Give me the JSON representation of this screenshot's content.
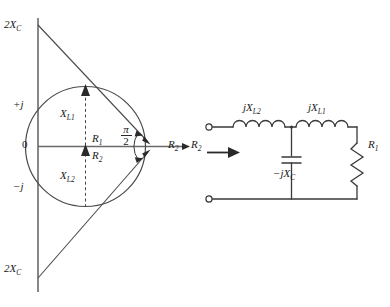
{
  "figure": {
    "type": "engineering-diagram"
  },
  "circle_diagram": {
    "axis_top_label": "2X",
    "axis_top_sub": "C",
    "axis_bottom_label": "2X",
    "axis_bottom_sub": "C",
    "axis_pos_imag": "+j",
    "axis_origin": "0",
    "axis_neg_imag": "−j",
    "axis_real_label": "R",
    "axis_real_sub": "2",
    "inner_upper_label": "X",
    "inner_upper_sub": "L1",
    "inner_center_upper_label": "R",
    "inner_center_upper_sub": "1",
    "inner_center_lower_label": "R",
    "inner_center_lower_sub": "2",
    "inner_lower_label": "X",
    "inner_lower_sub": "L2",
    "angle_numerator": "π",
    "angle_denominator": "2"
  },
  "circuit": {
    "inductor_left_label": "jX",
    "inductor_left_sub": "L2",
    "inductor_right_label": "jX",
    "inductor_right_sub": "L1",
    "capacitor_label": "−jX",
    "capacitor_sub": "C",
    "resistor_label": "R",
    "resistor_sub": "1",
    "input_label": "R",
    "input_sub": "2"
  },
  "colors": {
    "line": "#3a3a3a",
    "axis": "#555555",
    "text": "#1a1a1a",
    "background": "#ffffff"
  }
}
